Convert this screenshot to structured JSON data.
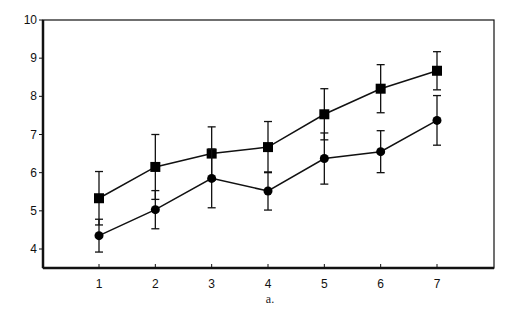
{
  "chart_data": {
    "type": "line",
    "title": "",
    "caption": "a.",
    "xlabel": "",
    "ylabel": "",
    "x": [
      1,
      2,
      3,
      4,
      5,
      6,
      7
    ],
    "xlim": [
      0,
      8
    ],
    "ylim": [
      3.5,
      10
    ],
    "yticks": [
      4,
      5,
      6,
      7,
      8,
      9,
      10
    ],
    "xticks": [
      1,
      2,
      3,
      4,
      5,
      6,
      7
    ],
    "grid": false,
    "legend": null,
    "series": [
      {
        "name": "squares",
        "marker": "square",
        "values": [
          5.33,
          6.15,
          6.5,
          6.67,
          7.53,
          8.2,
          8.67
        ],
        "error": [
          0.7,
          0.85,
          0.7,
          0.67,
          0.67,
          0.63,
          0.5
        ]
      },
      {
        "name": "circles",
        "marker": "circle",
        "values": [
          4.35,
          5.03,
          5.85,
          5.52,
          6.37,
          6.55,
          7.37
        ],
        "error": [
          0.43,
          0.5,
          0.77,
          0.5,
          0.67,
          0.55,
          0.65
        ]
      }
    ]
  }
}
